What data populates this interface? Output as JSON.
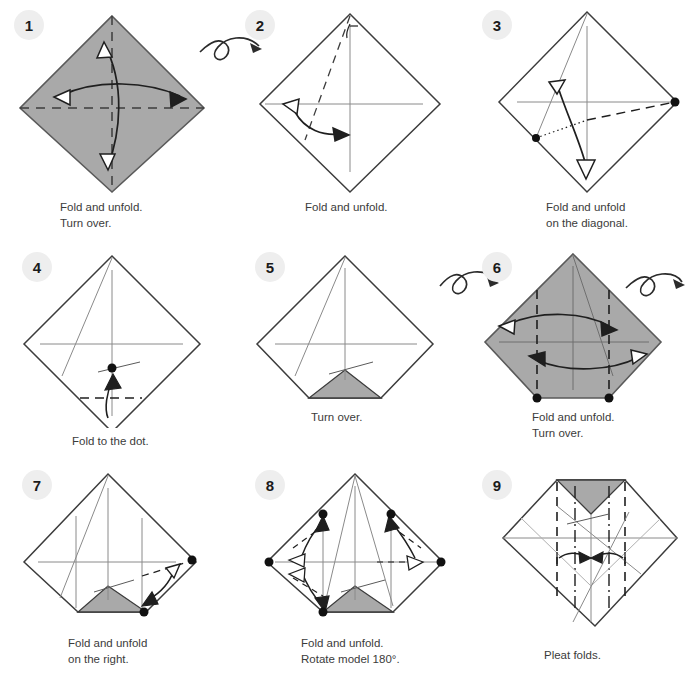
{
  "document": {
    "title": "Origami folding instructions",
    "background_color": "#ffffff",
    "paper_front_color": "#a9a9a9",
    "paper_back_color": "#ffffff",
    "line_color": "#3c3c3c",
    "badge_color": "#eeeeee",
    "text_color": "#3b3b3b"
  },
  "steps": [
    {
      "number": "1",
      "badge_label": "1",
      "caption": "Fold and unfold.\nTurn over.",
      "shape": "diamond",
      "fill": "gray",
      "creases": [
        "vertical-dashed",
        "horizontal-dashed"
      ],
      "arrows": [
        "vertical-double-curved",
        "horizontal-double-curved"
      ],
      "turn_over_symbol": true,
      "turn_over_position": "right"
    },
    {
      "number": "2",
      "badge_label": "2",
      "caption": "Fold and unfold.",
      "shape": "diamond",
      "fill": "white",
      "creases": [
        "vertical-thin",
        "horizontal-thin",
        "left-diagonal-dashed"
      ],
      "arrows": [
        "lower-left-double-curved"
      ],
      "turn_over_symbol": false
    },
    {
      "number": "3",
      "badge_label": "3",
      "caption": "Fold and unfold\non the diagonal.",
      "shape": "diamond",
      "fill": "white",
      "creases": [
        "vertical-thin",
        "horizontal-thin",
        "dotted-diagonal",
        "dashed-diagonal"
      ],
      "arrows": [
        "diagonal-double-curved"
      ],
      "dots": 2,
      "turn_over_symbol": false
    },
    {
      "number": "4",
      "badge_label": "4",
      "caption": "Fold to the dot.",
      "shape": "diamond",
      "fill": "white",
      "creases": [
        "vertical-thin",
        "horizontal-thin",
        "short-dashed-bottom"
      ],
      "arrows": [
        "up-curved"
      ],
      "dots": 1,
      "turn_over_symbol": false
    },
    {
      "number": "5",
      "badge_label": "5",
      "caption": "Turn over.",
      "shape": "truncated-diamond",
      "fill": "white",
      "accent": "bottom-gray-triangle",
      "creases": [
        "vertical-thin",
        "horizontal-thin"
      ],
      "arrows": [],
      "turn_over_symbol": true,
      "turn_over_position": "right"
    },
    {
      "number": "6",
      "badge_label": "6",
      "caption": "Fold and unfold.\nTurn over.",
      "shape": "truncated-diamond",
      "fill": "gray",
      "creases": [
        "vertical-thin",
        "horizontal-thin",
        "two-vertical-dashed"
      ],
      "arrows": [
        "upper-horizontal-double-curved",
        "lower-horizontal-double-curved"
      ],
      "dots": 2,
      "turn_over_symbol": true,
      "turn_over_position": "right"
    },
    {
      "number": "7",
      "badge_label": "7",
      "caption": "Fold and unfold\non the right.",
      "shape": "truncated-diamond",
      "fill": "white",
      "accent": "bottom-gray-triangle",
      "creases": [
        "vertical-thin",
        "horizontal-thin",
        "two-vertical-thin",
        "right-dashed"
      ],
      "arrows": [
        "right-double-curved"
      ],
      "dots": 2,
      "turn_over_symbol": false
    },
    {
      "number": "8",
      "badge_label": "8",
      "caption": "Fold and unfold.\nRotate model 180°.",
      "shape": "truncated-diamond",
      "fill": "white",
      "accent": "bottom-gray-triangle",
      "creases": [
        "vertical-thin",
        "horizontal-thin",
        "two-vertical-thin",
        "four-corner-dashed"
      ],
      "arrows": [
        "upper-left-double",
        "lower-left-double",
        "upper-right-double",
        "lower-right-double"
      ],
      "dots": 5,
      "turn_over_symbol": false
    },
    {
      "number": "9",
      "badge_label": "9",
      "caption": "Pleat folds.",
      "shape": "wide-diamond",
      "fill": "white",
      "accent": "top-gray-triangle",
      "creases": [
        "two-vertical-dashed",
        "two-vertical-dashdot",
        "horizontal-thin"
      ],
      "arrows": [
        "pleat-left-inward",
        "pleat-right-inward"
      ],
      "turn_over_symbol": false
    }
  ],
  "symbols": {
    "turn_over": "turn-over-loop-arrow",
    "valley_fold": "dashed-line",
    "mountain_fold": "dash-dot-line",
    "x_ray": "dotted-line",
    "unfold_arrow": "hollow-arrowhead",
    "fold_arrow": "solid-arrowhead",
    "reference_point": "filled-dot"
  }
}
